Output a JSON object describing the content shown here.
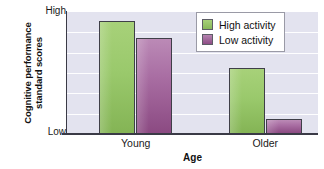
{
  "chart_data": {
    "type": "bar",
    "title": "",
    "subtitle": "",
    "xlabel": "Age",
    "ylabel": "Cognitive performance\nstandard scores",
    "ylabel_line1": "Cognitive performance",
    "ylabel_line2": "standard scores",
    "categories": [
      "Young",
      "Older"
    ],
    "series": [
      {
        "name": "High activity",
        "color": "#9ac96c",
        "values": [
          0.93,
          0.54
        ]
      },
      {
        "name": "Low activity",
        "color": "#a96ea3",
        "values": [
          0.79,
          0.12
        ]
      }
    ],
    "ylim": [
      0,
      1
    ],
    "y_tick_labels": [
      "Low",
      "High"
    ],
    "y_axis_min_label": "Low",
    "y_axis_max_label": "High",
    "y_numeric_ticks": false,
    "grid": true,
    "gridline_count": 6,
    "legend_position": "top-right",
    "plot_background": "#e3e3ef",
    "axis_color": "#3a3a46",
    "gridline_color": "#ffffff"
  },
  "legend": {
    "items": [
      {
        "label": "High activity",
        "swatch": "high-activity-swatch"
      },
      {
        "label": "Low activity",
        "swatch": "low-activity-swatch"
      }
    ]
  },
  "axes": {
    "y_top_label": "High",
    "y_bottom_label": "Low",
    "x_title": "Age",
    "x_tick_0": "Young",
    "x_tick_1": "Older"
  }
}
